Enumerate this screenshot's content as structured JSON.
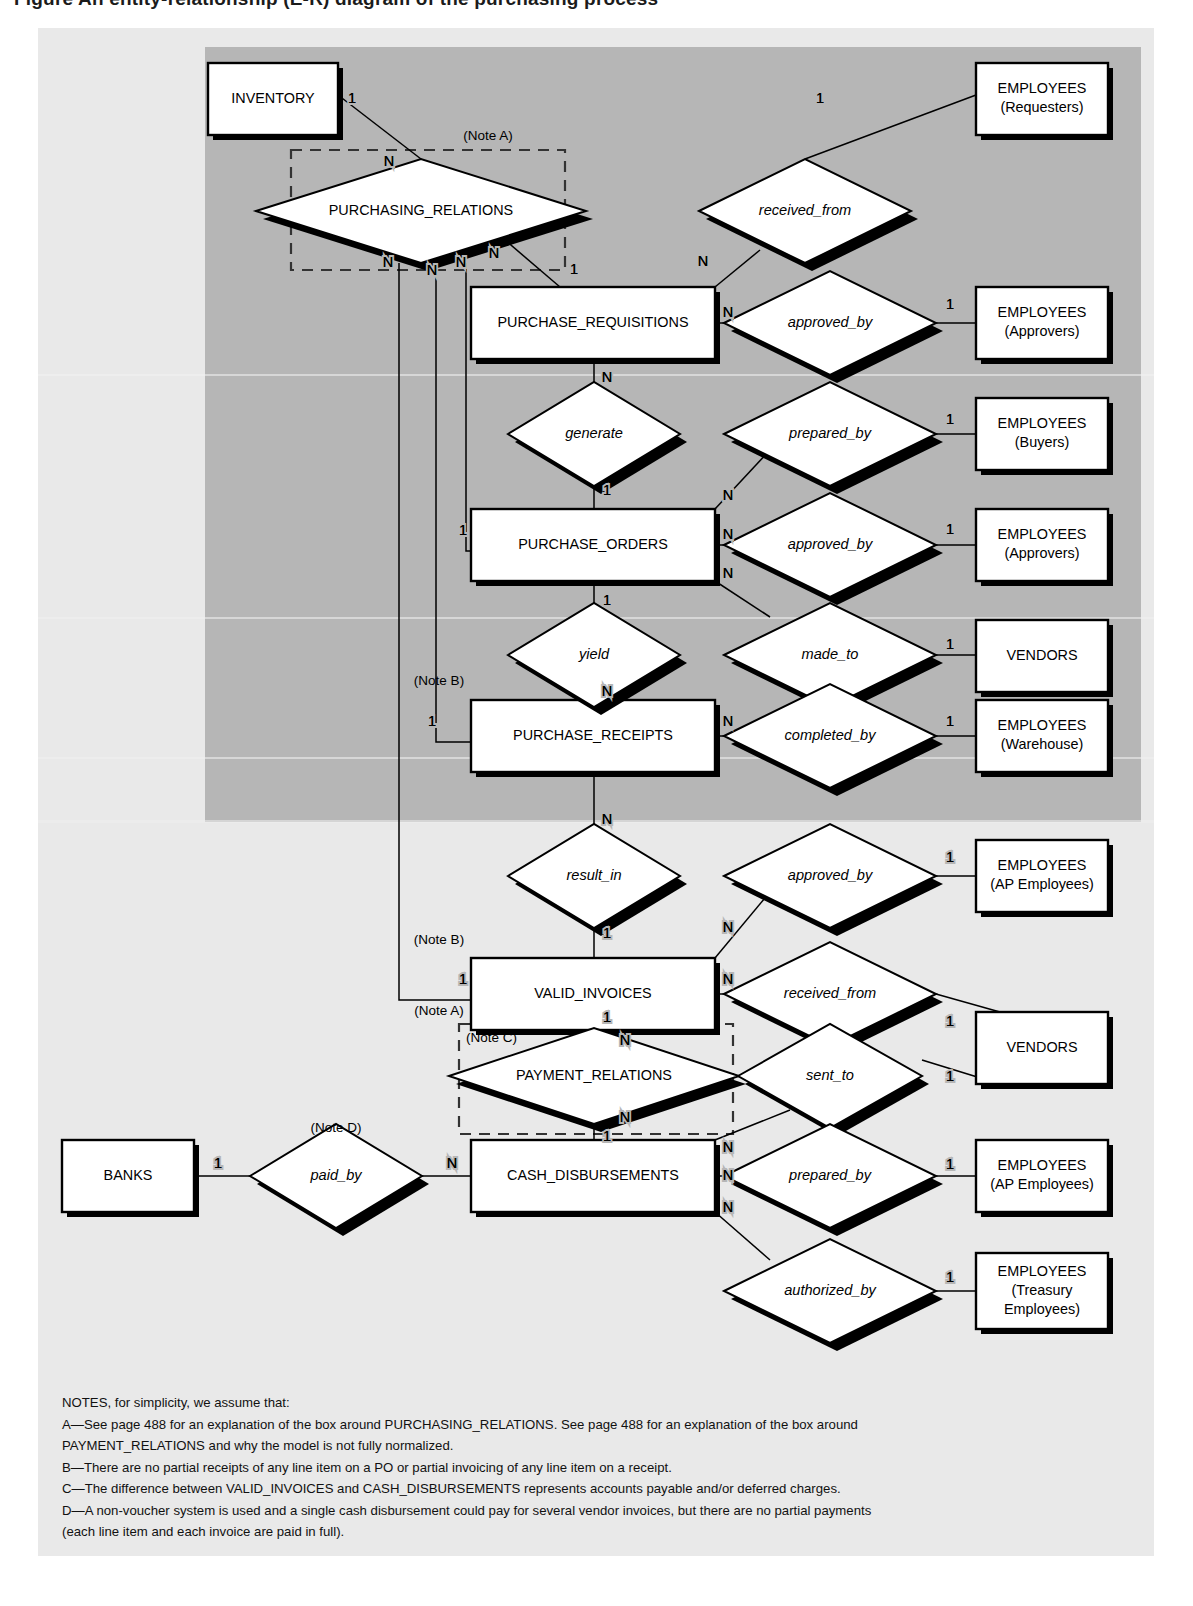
{
  "figure": {
    "title": "Figure    An entity-relationship (E-R) diagram of the purchasing process",
    "canvas": {
      "width": 1193,
      "height": 1606
    },
    "outer_panel": {
      "x": 38,
      "y": 28,
      "w": 1116,
      "h": 1528,
      "fill": "#e8e8e8"
    },
    "inner_shade": {
      "x": 205,
      "y": 47,
      "w": 936,
      "h": 775,
      "fill": "#b5b5b5"
    }
  },
  "entities": [
    {
      "id": "inventory",
      "label": "INVENTORY",
      "sublabel": "",
      "x": 208,
      "y": 63,
      "w": 130,
      "h": 72
    },
    {
      "id": "emp_req",
      "label": "EMPLOYEES",
      "sublabel": "(Requesters)",
      "x": 976,
      "y": 63,
      "w": 132,
      "h": 72
    },
    {
      "id": "pur_req",
      "label": "PURCHASE_REQUISITIONS",
      "sublabel": "",
      "x": 471,
      "y": 287,
      "w": 244,
      "h": 72
    },
    {
      "id": "emp_appr1",
      "label": "EMPLOYEES",
      "sublabel": "(Approvers)",
      "x": 976,
      "y": 287,
      "w": 132,
      "h": 72
    },
    {
      "id": "pur_ord",
      "label": "PURCHASE_ORDERS",
      "sublabel": "",
      "x": 471,
      "y": 509,
      "w": 244,
      "h": 72
    },
    {
      "id": "emp_buy",
      "label": "EMPLOYEES",
      "sublabel": "(Buyers)",
      "x": 976,
      "y": 398,
      "w": 132,
      "h": 72
    },
    {
      "id": "emp_appr2",
      "label": "EMPLOYEES",
      "sublabel": "(Approvers)",
      "x": 976,
      "y": 509,
      "w": 132,
      "h": 72
    },
    {
      "id": "vendors1",
      "label": "VENDORS",
      "sublabel": "",
      "x": 976,
      "y": 620,
      "w": 132,
      "h": 72
    },
    {
      "id": "pur_rec",
      "label": "PURCHASE_RECEIPTS",
      "sublabel": "",
      "x": 471,
      "y": 700,
      "w": 244,
      "h": 72
    },
    {
      "id": "emp_wh",
      "label": "EMPLOYEES",
      "sublabel": "(Warehouse)",
      "x": 976,
      "y": 700,
      "w": 132,
      "h": 72
    },
    {
      "id": "emp_ap1",
      "label": "EMPLOYEES",
      "sublabel": "(AP Employees)",
      "x": 976,
      "y": 840,
      "w": 132,
      "h": 72
    },
    {
      "id": "valid_inv",
      "label": "VALID_INVOICES",
      "sublabel": "",
      "x": 471,
      "y": 958,
      "w": 244,
      "h": 72
    },
    {
      "id": "vendors2",
      "label": "VENDORS",
      "sublabel": "",
      "x": 976,
      "y": 1012,
      "w": 132,
      "h": 72
    },
    {
      "id": "banks",
      "label": "BANKS",
      "sublabel": "",
      "x": 62,
      "y": 1140,
      "w": 132,
      "h": 72
    },
    {
      "id": "cash_disb",
      "label": "CASH_DISBURSEMENTS",
      "sublabel": "",
      "x": 471,
      "y": 1140,
      "w": 244,
      "h": 72
    },
    {
      "id": "emp_ap2",
      "label": "EMPLOYEES",
      "sublabel": "(AP Employees)",
      "x": 976,
      "y": 1140,
      "w": 132,
      "h": 72
    },
    {
      "id": "emp_treas",
      "label": "EMPLOYEES",
      "sublabel": "(Treasury",
      "sublabel2": "Employees)",
      "x": 976,
      "y": 1253,
      "w": 132,
      "h": 76
    }
  ],
  "relationships": [
    {
      "id": "purchasing_relations",
      "label": "PURCHASING_RELATIONS",
      "italic": false,
      "cx": 421,
      "cy": 211,
      "rx": 165,
      "ry": 52
    },
    {
      "id": "received_from_1",
      "label": "received_from",
      "italic": true,
      "cx": 805,
      "cy": 211,
      "rx": 106,
      "ry": 52
    },
    {
      "id": "approved_by_req",
      "label": "approved_by",
      "italic": true,
      "cx": 830,
      "cy": 323,
      "rx": 106,
      "ry": 52
    },
    {
      "id": "generate",
      "label": "generate",
      "italic": true,
      "cx": 594,
      "cy": 434,
      "rx": 86,
      "ry": 52
    },
    {
      "id": "prepared_by_po",
      "label": "prepared_by",
      "italic": true,
      "cx": 830,
      "cy": 434,
      "rx": 106,
      "ry": 52
    },
    {
      "id": "approved_by_po",
      "label": "approved_by",
      "italic": true,
      "cx": 830,
      "cy": 545,
      "rx": 106,
      "ry": 52
    },
    {
      "id": "yield",
      "label": "yield",
      "italic": true,
      "cx": 594,
      "cy": 655,
      "rx": 86,
      "ry": 52
    },
    {
      "id": "made_to",
      "label": "made_to",
      "italic": true,
      "cx": 830,
      "cy": 655,
      "rx": 106,
      "ry": 52
    },
    {
      "id": "completed_by",
      "label": "completed_by",
      "italic": true,
      "cx": 830,
      "cy": 736,
      "rx": 106,
      "ry": 52
    },
    {
      "id": "result_in",
      "label": "result_in",
      "italic": true,
      "cx": 594,
      "cy": 876,
      "rx": 86,
      "ry": 52
    },
    {
      "id": "approved_by_inv",
      "label": "approved_by",
      "italic": true,
      "cx": 830,
      "cy": 876,
      "rx": 106,
      "ry": 52
    },
    {
      "id": "received_from_2",
      "label": "received_from",
      "italic": true,
      "cx": 830,
      "cy": 994,
      "rx": 106,
      "ry": 52
    },
    {
      "id": "payment_relations",
      "label": "PAYMENT_RELATIONS",
      "italic": false,
      "cx": 594,
      "cy": 1076,
      "rx": 145,
      "ry": 48
    },
    {
      "id": "sent_to",
      "label": "sent_to",
      "italic": true,
      "cx": 830,
      "cy": 1076,
      "rx": 92,
      "ry": 52
    },
    {
      "id": "paid_by",
      "label": "paid_by",
      "italic": true,
      "cx": 336,
      "cy": 1176,
      "rx": 86,
      "ry": 52
    },
    {
      "id": "prepared_by_cd",
      "label": "prepared_by",
      "italic": true,
      "cx": 830,
      "cy": 1176,
      "rx": 106,
      "ry": 52
    },
    {
      "id": "authorized_by",
      "label": "authorized_by",
      "italic": true,
      "cx": 830,
      "cy": 1291,
      "rx": 106,
      "ry": 52
    }
  ],
  "dashed_boxes": [
    {
      "id": "note-a-box-purchasing",
      "x": 291,
      "y": 150,
      "w": 274,
      "h": 120
    },
    {
      "id": "note-a-box-payment",
      "x": 459,
      "y": 1024,
      "w": 274,
      "h": 110
    }
  ],
  "note_markers": [
    {
      "id": "note-a-top",
      "text": "(Note A)",
      "x": 488,
      "y": 136,
      "anchor": "middle"
    },
    {
      "id": "note-b-receipts",
      "text": "(Note B)",
      "x": 439,
      "y": 681,
      "anchor": "middle"
    },
    {
      "id": "note-b-invoices",
      "text": "(Note B)",
      "x": 439,
      "y": 940,
      "anchor": "middle"
    },
    {
      "id": "note-a-payment",
      "text": "(Note A)",
      "x": 439,
      "y": 1011,
      "anchor": "middle"
    },
    {
      "id": "note-c-payment",
      "text": "(Note C)",
      "x": 466,
      "y": 1038,
      "anchor": "start"
    },
    {
      "id": "note-d-paidby",
      "text": "(Note D)",
      "x": 336,
      "y": 1128,
      "anchor": "middle"
    }
  ],
  "cardinalities": [
    {
      "id": "card-inventory-1",
      "text": "1",
      "x": 352,
      "y": 99
    },
    {
      "id": "card-pr-inv-n",
      "text": "N",
      "x": 389,
      "y": 162
    },
    {
      "id": "card-emp-req-1",
      "text": "1",
      "x": 820,
      "y": 99
    },
    {
      "id": "card-recvfrom-n",
      "text": "N",
      "x": 703,
      "y": 262
    },
    {
      "id": "card-pr-n1",
      "text": "N",
      "x": 388,
      "y": 263
    },
    {
      "id": "card-pr-n2",
      "text": "N",
      "x": 432,
      "y": 271
    },
    {
      "id": "card-pr-n3",
      "text": "N",
      "x": 461,
      "y": 263
    },
    {
      "id": "card-pr-n4",
      "text": "N",
      "x": 494,
      "y": 254
    },
    {
      "id": "card-pr-req-1",
      "text": "1",
      "x": 574,
      "y": 270
    },
    {
      "id": "card-req-appr-n",
      "text": "N",
      "x": 728,
      "y": 313
    },
    {
      "id": "card-appr1-1",
      "text": "1",
      "x": 950,
      "y": 305
    },
    {
      "id": "card-req-gen-n",
      "text": "N",
      "x": 607,
      "y": 378
    },
    {
      "id": "card-gen-1",
      "text": "1",
      "x": 607,
      "y": 491
    },
    {
      "id": "card-po-prep-n",
      "text": "N",
      "x": 728,
      "y": 496
    },
    {
      "id": "card-buy-1",
      "text": "1",
      "x": 950,
      "y": 420
    },
    {
      "id": "card-po-appr-n",
      "text": "N",
      "x": 728,
      "y": 535
    },
    {
      "id": "card-appr2-1",
      "text": "1",
      "x": 950,
      "y": 530
    },
    {
      "id": "card-po-yield-1",
      "text": "1",
      "x": 607,
      "y": 601
    },
    {
      "id": "card-po-made-n",
      "text": "N",
      "x": 728,
      "y": 574
    },
    {
      "id": "card-vendors1-1",
      "text": "1",
      "x": 950,
      "y": 645
    },
    {
      "id": "card-pr-po-1",
      "text": "1",
      "x": 463,
      "y": 531
    },
    {
      "id": "card-yield-n",
      "text": "N",
      "x": 607,
      "y": 692
    },
    {
      "id": "card-pr-rec-1",
      "text": "1",
      "x": 432,
      "y": 722
    },
    {
      "id": "card-rec-comp-n",
      "text": "N",
      "x": 728,
      "y": 722
    },
    {
      "id": "card-wh-1",
      "text": "1",
      "x": 950,
      "y": 722
    },
    {
      "id": "card-rec-res-n",
      "text": "N",
      "x": 607,
      "y": 820
    },
    {
      "id": "card-res-1",
      "text": "1",
      "x": 607,
      "y": 934
    },
    {
      "id": "card-inv-appr-n",
      "text": "N",
      "x": 728,
      "y": 928
    },
    {
      "id": "card-ap1-1",
      "text": "1",
      "x": 950,
      "y": 858
    },
    {
      "id": "card-pr-inv-1",
      "text": "1",
      "x": 463,
      "y": 980
    },
    {
      "id": "card-inv-recv-n",
      "text": "N",
      "x": 728,
      "y": 980
    },
    {
      "id": "card-vendors2-1a",
      "text": "1",
      "x": 950,
      "y": 1022
    },
    {
      "id": "card-vendors2-1b",
      "text": "1",
      "x": 950,
      "y": 1077
    },
    {
      "id": "card-inv-pay-1",
      "text": "1",
      "x": 607,
      "y": 1018
    },
    {
      "id": "card-pay-n-top",
      "text": "N",
      "x": 625,
      "y": 1041
    },
    {
      "id": "card-pay-n-bot",
      "text": "N",
      "x": 625,
      "y": 1118
    },
    {
      "id": "card-pay-cd-1",
      "text": "1",
      "x": 607,
      "y": 1137
    },
    {
      "id": "card-banks-1",
      "text": "1",
      "x": 218,
      "y": 1164
    },
    {
      "id": "card-paidby-n",
      "text": "N",
      "x": 452,
      "y": 1164
    },
    {
      "id": "card-cd-sent-n",
      "text": "N",
      "x": 728,
      "y": 1148
    },
    {
      "id": "card-cd-prep-n",
      "text": "N",
      "x": 728,
      "y": 1176
    },
    {
      "id": "card-cd-auth-n",
      "text": "N",
      "x": 728,
      "y": 1208
    },
    {
      "id": "card-ap2-1",
      "text": "1",
      "x": 950,
      "y": 1165
    },
    {
      "id": "card-treas-1",
      "text": "1",
      "x": 950,
      "y": 1278
    }
  ],
  "notes": {
    "heading": "NOTES, for simplicity, we assume that:",
    "items": [
      "A—See page 488 for an explanation of the box around PURCHASING_RELATIONS. See page 488 for an explanation of the box around",
      "     PAYMENT_RELATIONS and why the model is not fully normalized.",
      "B—There are no partial receipts of any line item on a PO or partial invoicing of any line item on a receipt.",
      "C—The difference between VALID_INVOICES and CASH_DISBURSEMENTS represents accounts payable and/or deferred charges.",
      "D—A non-voucher system is used and a single cash disbursement could pay for several vendor invoices, but there are no partial payments",
      "     (each line item and each invoice are paid in full)."
    ],
    "x": 62,
    "y_start": 1404,
    "line_height": 21.5
  },
  "colors": {
    "page_background": "#ffffff",
    "panel_background": "#e8e8e8",
    "inner_shade": "#b5b5b5",
    "shape_fill": "#ffffff",
    "line": "#000000",
    "dashed_border": "#333333"
  }
}
